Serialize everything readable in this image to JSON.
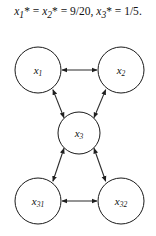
{
  "caption": {
    "full_text": "x₁* = x₂* = 9/20, x₃* = 1/5.",
    "parts": [
      {
        "var": "x",
        "sub": "1",
        "star": "*"
      },
      {
        "var": "x",
        "sub": "2",
        "star": "*"
      },
      {
        "var": "x",
        "sub": "3",
        "star": "*"
      }
    ],
    "values": {
      "x1_star": "9/20",
      "x2_star": "9/20",
      "x3_star": "1/5"
    },
    "equals": "=",
    "comma": ",",
    "period": "."
  },
  "diagram": {
    "type": "directed-graph",
    "background_color": "#ffffff",
    "node_fill": "#ffffff",
    "node_stroke": "#1a1a1a",
    "edge_color": "#2b2b2b",
    "nodes": [
      {
        "id": "x1",
        "base": "x",
        "sub": "1",
        "cx": 38,
        "cy": 46,
        "r": 23
      },
      {
        "id": "x2",
        "base": "x",
        "sub": "2",
        "cx": 121,
        "cy": 46,
        "r": 23
      },
      {
        "id": "x3",
        "base": "x",
        "sub": "3",
        "cx": 79,
        "cy": 109,
        "r": 21
      },
      {
        "id": "x31",
        "base": "x",
        "sub": "31",
        "cx": 38,
        "cy": 177,
        "r": 23
      },
      {
        "id": "x32",
        "base": "x",
        "sub": "32",
        "cx": 121,
        "cy": 177,
        "r": 23
      }
    ],
    "edges": [
      {
        "from": "x1",
        "to": "x2",
        "direction": "bidirectional"
      },
      {
        "from": "x3",
        "to": "x1",
        "direction": "bidirectional"
      },
      {
        "from": "x3",
        "to": "x2",
        "direction": "bidirectional"
      },
      {
        "from": "x3",
        "to": "x31",
        "direction": "bidirectional"
      },
      {
        "from": "x3",
        "to": "x32",
        "direction": "bidirectional"
      },
      {
        "from": "x31",
        "to": "x32",
        "direction": "bidirectional"
      }
    ]
  }
}
